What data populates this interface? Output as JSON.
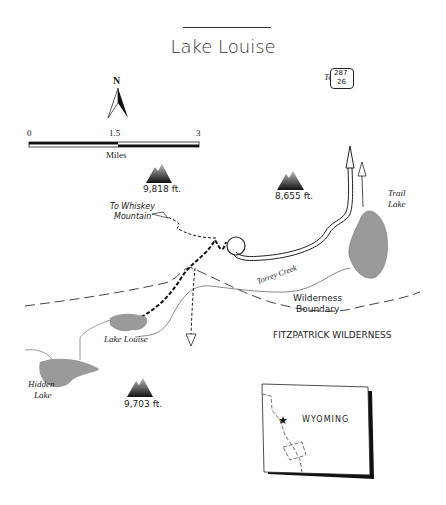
{
  "title": "Lake Louise",
  "north_arrow": {
    "label": "N"
  },
  "scale_bar": {
    "ticks": [
      "0",
      "1.5",
      "3"
    ],
    "unit": "Miles"
  },
  "peaks": [
    {
      "elevation": "9,818 ft."
    },
    {
      "elevation": "8,655 ft."
    },
    {
      "elevation": "9,703 ft."
    }
  ],
  "lakes": [
    {
      "name_line1": "Trail",
      "name_line2": "Lake"
    },
    {
      "name": "Lake Louise"
    },
    {
      "name_line1": "Hidden",
      "name_line2": "Lake"
    }
  ],
  "labels": {
    "to_whiskey_line1": "To Whiskey",
    "to_whiskey_line2": "Mountain",
    "to_route": "To",
    "route_top": "287",
    "route_bottom": "26",
    "creek": "Torrey Creek",
    "boundary_line1": "Wilderness",
    "boundary_line2": "Boundary",
    "wilderness": "FITZPATRICK WILDERNESS"
  },
  "inset": {
    "state": "WYOMING",
    "marker": "star"
  },
  "colors": {
    "lake_fill": "#9a9a9a",
    "line": "#333333",
    "background": "#ffffff"
  }
}
